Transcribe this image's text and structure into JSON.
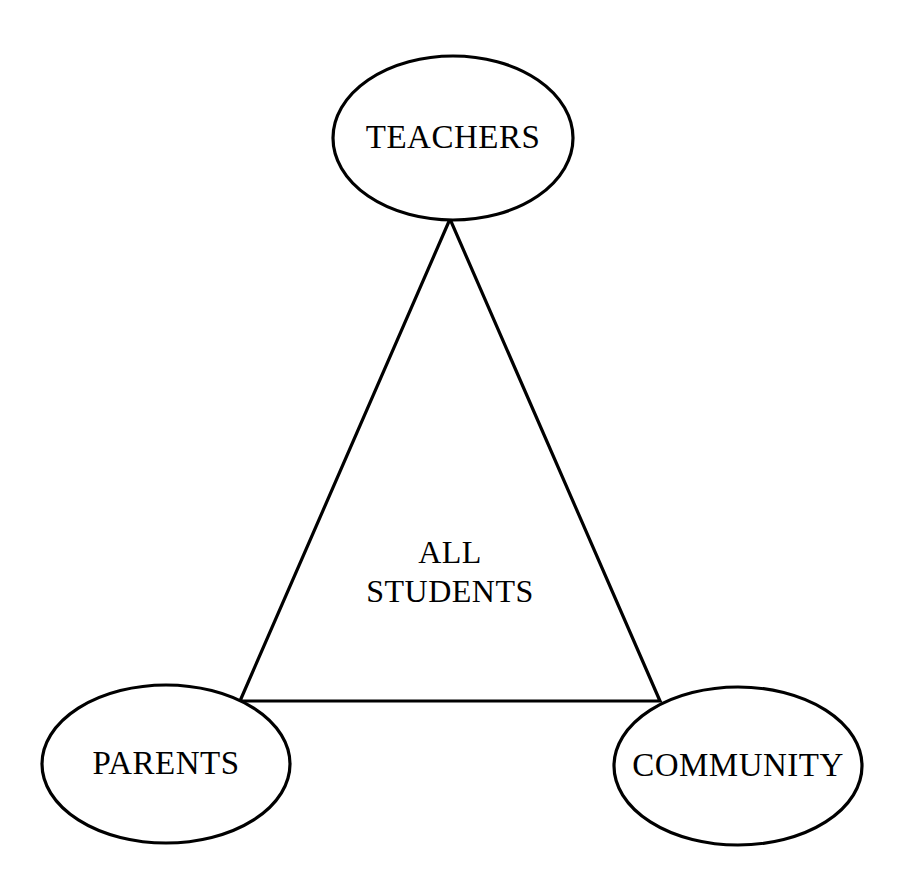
{
  "diagram": {
    "type": "relationship-triangle",
    "background_color": "#ffffff",
    "stroke_color": "#000000",
    "fill_color": "#ffffff",
    "nodes": [
      {
        "id": "teachers",
        "label": "TEACHERS",
        "shape": "ellipse",
        "position": "top",
        "cx": 453,
        "cy": 138,
        "rx": 120,
        "ry": 82
      },
      {
        "id": "parents",
        "label": "PARENTS",
        "shape": "ellipse",
        "position": "bottom-left",
        "cx": 166,
        "cy": 764,
        "rx": 124,
        "ry": 79
      },
      {
        "id": "community",
        "label": "COMMUNITY",
        "shape": "ellipse",
        "position": "bottom-right",
        "cx": 738,
        "cy": 766,
        "rx": 124,
        "ry": 79
      }
    ],
    "center": {
      "id": "all-students",
      "line1": "ALL",
      "line2": "STUDENTS",
      "x": 450,
      "y1": 563,
      "y2": 602
    },
    "connector": {
      "id": "triangle",
      "shape": "triangle",
      "points": "450,219 240,701 660,701",
      "edges": [
        {
          "from": "teachers",
          "to": "parents"
        },
        {
          "from": "parents",
          "to": "community"
        },
        {
          "from": "community",
          "to": "teachers"
        }
      ]
    }
  }
}
